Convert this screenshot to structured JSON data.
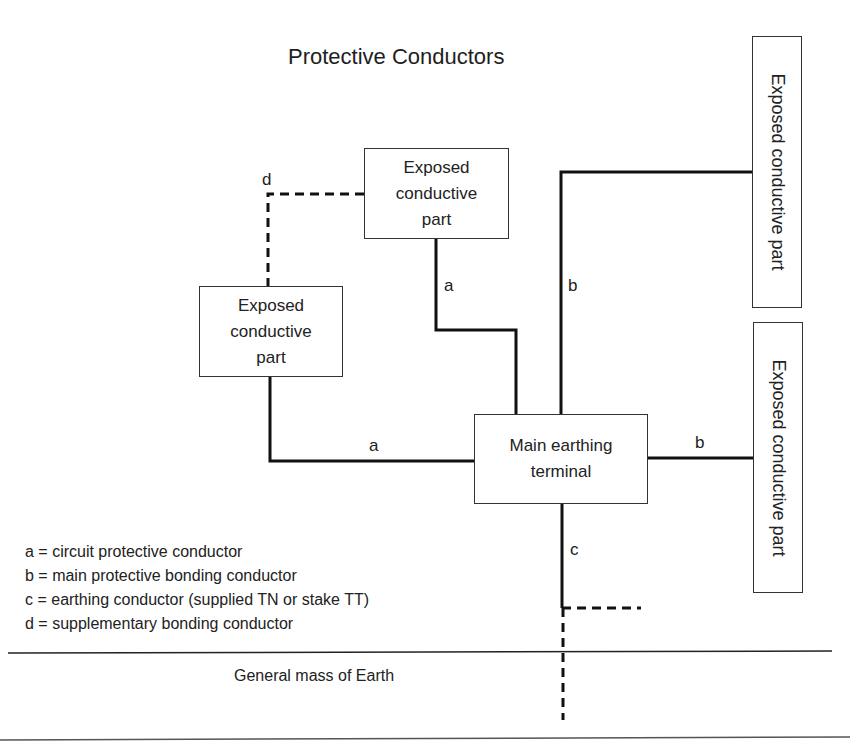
{
  "title": "Protective Conductors",
  "boxes": {
    "top_middle": {
      "lines": [
        "Exposed",
        "conductive",
        "part"
      ]
    },
    "left": {
      "lines": [
        "Exposed",
        "conductive",
        "part"
      ]
    },
    "main_terminal": {
      "lines": [
        "Main earthing",
        "terminal"
      ]
    },
    "right_top": {
      "label": "Exposed conductive part"
    },
    "right_bottom": {
      "label": "Exposed conductive part"
    }
  },
  "wire_labels": {
    "d": "d",
    "a_top": "a",
    "a_left": "a",
    "b_top": "b",
    "b_right": "b",
    "c": "c"
  },
  "legend": [
    "a = circuit protective conductor",
    "b = main protective bonding conductor",
    "c = earthing conductor (supplied TN or stake TT)",
    "d = supplementary bonding conductor"
  ],
  "ground_label": "General mass of Earth",
  "colors": {
    "line": "#111111",
    "box_border": "#333333",
    "background": "#ffffff"
  }
}
